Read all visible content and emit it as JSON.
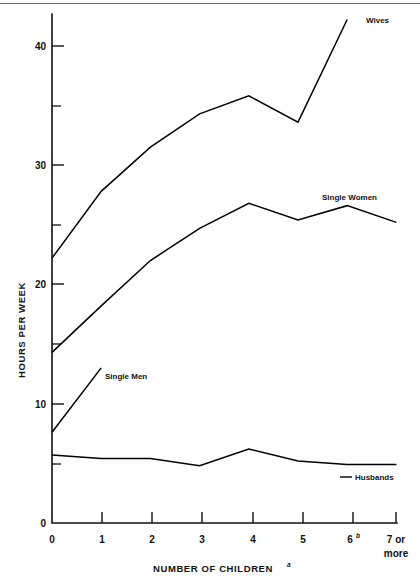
{
  "chart_data": {
    "type": "line",
    "title": "",
    "xlabel": "NUMBER OF CHILDREN",
    "xlabel_superscript": "a",
    "ylabel": "HOURS PER WEEK",
    "xlim": [
      0,
      7
    ],
    "ylim": [
      0,
      43
    ],
    "grid": false,
    "legend_position": "inline-end-labels",
    "categories": [
      "0",
      "1",
      "2",
      "3",
      "4",
      "5",
      "6",
      "7 or more"
    ],
    "x_tick_labels": [
      "0",
      "1",
      "2",
      "3",
      "4",
      "5",
      "6",
      "7 or\nmore"
    ],
    "x_tick_superscripts": [
      "",
      "",
      "",
      "",
      "",
      "",
      "b",
      ""
    ],
    "y_tick_labels": [
      "0",
      "10",
      "20",
      "30",
      "40"
    ],
    "y_ticks_major": [
      0,
      10,
      20,
      30,
      40
    ],
    "y_ticks_minor": [
      5,
      15,
      25,
      35
    ],
    "series": [
      {
        "name": "Wives",
        "x": [
          0,
          1,
          2,
          3,
          4,
          5,
          6
        ],
        "values": [
          22.2,
          27.8,
          31.5,
          34.3,
          35.8,
          33.6,
          42.2
        ],
        "label_x": 6,
        "label_text": "Wives"
      },
      {
        "name": "Single Women",
        "x": [
          0,
          1,
          2,
          3,
          4,
          5,
          6,
          7
        ],
        "values": [
          14.3,
          18.2,
          22.0,
          24.7,
          26.8,
          25.4,
          26.6,
          25.2
        ],
        "label_text": "Single Women"
      },
      {
        "name": "Single Men",
        "x": [
          0,
          1
        ],
        "values": [
          7.6,
          13.0
        ],
        "label_text": "Single Men"
      },
      {
        "name": "Husbands",
        "x": [
          0,
          1,
          2,
          3,
          4,
          5,
          6,
          7
        ],
        "values": [
          5.7,
          5.4,
          5.4,
          4.8,
          6.2,
          5.2,
          4.9,
          4.9
        ],
        "label_text": "Husbands"
      }
    ]
  },
  "axis": {
    "y_label": "HOURS PER WEEK",
    "x_label": "NUMBER OF CHILDREN",
    "x_label_sup": "a",
    "y_tick_40": "40",
    "y_tick_30": "30",
    "y_tick_20": "20",
    "y_tick_10": "10",
    "y_tick_0": "0",
    "x_tick_0": "0",
    "x_tick_1": "1",
    "x_tick_2": "2",
    "x_tick_3": "3",
    "x_tick_4": "4",
    "x_tick_5": "5",
    "x_tick_6": "6",
    "x_tick_6_sup": "b",
    "x_tick_7_line1": "7 or",
    "x_tick_7_line2": "more"
  },
  "series_labels": {
    "wives": "Wives",
    "single_women": "Single Women",
    "single_men": "Single Men",
    "husbands": "Husbands"
  }
}
